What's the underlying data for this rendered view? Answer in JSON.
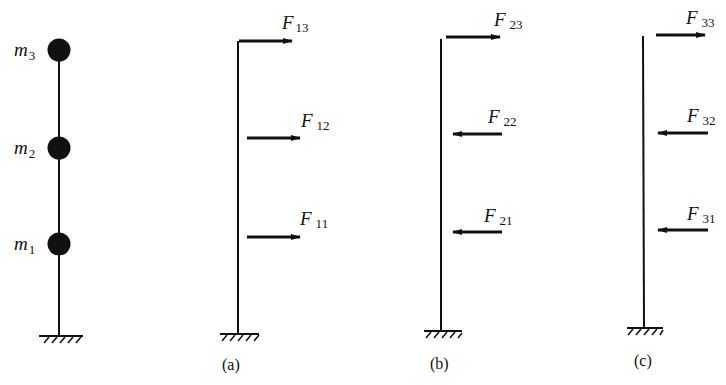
{
  "figure": {
    "model": {
      "masses": [
        {
          "symbol": "m",
          "index": "3"
        },
        {
          "symbol": "m",
          "index": "2"
        },
        {
          "symbol": "m",
          "index": "1"
        }
      ]
    },
    "panels": [
      {
        "caption": "(a)",
        "forces": [
          {
            "symbol": "F",
            "index": "13",
            "direction": "right"
          },
          {
            "symbol": "F",
            "index": "12",
            "direction": "right"
          },
          {
            "symbol": "F",
            "index": "11",
            "direction": "right"
          }
        ]
      },
      {
        "caption": "(b)",
        "forces": [
          {
            "symbol": "F",
            "index": "23",
            "direction": "right"
          },
          {
            "symbol": "F",
            "index": "22",
            "direction": "left"
          },
          {
            "symbol": "F",
            "index": "21",
            "direction": "left"
          }
        ]
      },
      {
        "caption": "(c)",
        "forces": [
          {
            "symbol": "F",
            "index": "33",
            "direction": "right"
          },
          {
            "symbol": "F",
            "index": "32",
            "direction": "left"
          },
          {
            "symbol": "F",
            "index": "31",
            "direction": "left"
          }
        ]
      }
    ]
  }
}
